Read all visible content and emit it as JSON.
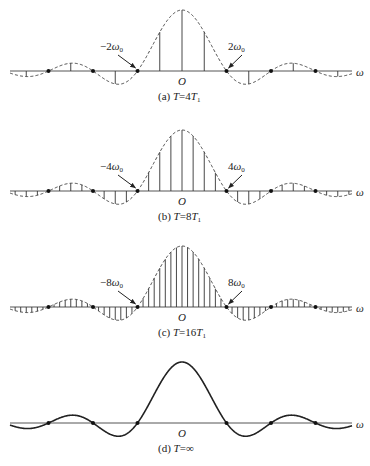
{
  "figure": {
    "center_x": 182,
    "axis_x_start": 10,
    "axis_x_end": 352,
    "zero_spacing_px": 44.5,
    "main_lobe_height_px": 61,
    "axis_symbol": "ω",
    "origin_label": "O",
    "panels": [
      {
        "id": "a",
        "axis_y": 71,
        "caption_prefix": "(a) ",
        "caption_T": "T",
        "caption_rest": "=4",
        "caption_T1": "T",
        "caption_sub": "1",
        "stem_spacing_px": 22.25,
        "style": "stems",
        "left_marker_label": "−2ω",
        "right_marker_label": "2ω",
        "marker_sub": "0",
        "left_label_pos": [
          100,
          50
        ],
        "right_label_pos": [
          228,
          50
        ]
      },
      {
        "id": "b",
        "axis_y": 191,
        "caption_prefix": "(b) ",
        "caption_T": "T",
        "caption_rest": "=8",
        "caption_T1": "T",
        "caption_sub": "1",
        "stem_spacing_px": 11.125,
        "style": "stems",
        "left_marker_label": "−4ω",
        "right_marker_label": "4ω",
        "marker_sub": "0",
        "left_label_pos": [
          100,
          170
        ],
        "right_label_pos": [
          228,
          170
        ]
      },
      {
        "id": "c",
        "axis_y": 307,
        "caption_prefix": "(c) ",
        "caption_T": "T",
        "caption_rest": "=16",
        "caption_T1": "T",
        "caption_sub": "1",
        "stem_spacing_px": 5.5625,
        "style": "stems",
        "left_marker_label": "−8ω",
        "right_marker_label": "8ω",
        "marker_sub": "0",
        "left_label_pos": [
          100,
          286
        ],
        "right_label_pos": [
          228,
          286
        ]
      },
      {
        "id": "d",
        "axis_y": 423,
        "caption_prefix": "(d) ",
        "caption_T": "T",
        "caption_rest": "=∞",
        "caption_T1": "",
        "caption_sub": "",
        "stem_spacing_px": 0,
        "style": "continuous"
      }
    ]
  },
  "chart_data": {
    "type": "line",
    "xlabel": "ω",
    "ylabel": "",
    "series": [
      {
        "name": "(a) T=4T1",
        "kind": "stems+dashed envelope",
        "first_zero": "±2ω0",
        "lines_per_zero_interval": 2
      },
      {
        "name": "(b) T=8T1",
        "kind": "stems+dashed envelope",
        "first_zero": "±4ω0",
        "lines_per_zero_interval": 4
      },
      {
        "name": "(c) T=16T1",
        "kind": "stems+dashed envelope",
        "first_zero": "±8ω0",
        "lines_per_zero_interval": 8
      },
      {
        "name": "(d) T=∞",
        "kind": "continuous solid curve",
        "first_zero": "",
        "lines_per_zero_interval": 0
      }
    ],
    "envelope_zeros_visible_each_side": 3,
    "grid": false,
    "legend": "none"
  }
}
